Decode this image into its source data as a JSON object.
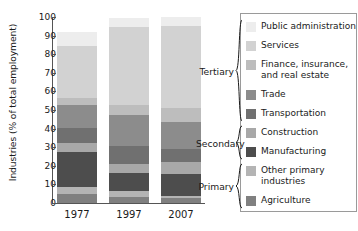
{
  "chart_data": {
    "type": "bar",
    "stacked": true,
    "title": "",
    "xlabel": "",
    "ylabel": "Industries (% of total employment)",
    "categories": [
      "1977",
      "1997",
      "2007"
    ],
    "ylim": [
      0,
      100
    ],
    "yticks": [
      0,
      10,
      20,
      30,
      40,
      50,
      60,
      70,
      80,
      90,
      100
    ],
    "grid": false,
    "legend_position": "right",
    "series": [
      {
        "name": "Agriculture",
        "group": "Primary",
        "color": "#808080",
        "values": [
          5.0,
          3.5,
          2.5
        ]
      },
      {
        "name": "Other primary industries",
        "group": "Primary",
        "color": "#b4b4b4",
        "values": [
          3.5,
          3.0,
          1.5
        ]
      },
      {
        "name": "Manufacturing",
        "group": "Secondary",
        "color": "#4d4d4d",
        "values": [
          19.0,
          9.5,
          11.5
        ]
      },
      {
        "name": "Construction",
        "group": "Secondary",
        "color": "#a8a8a8",
        "values": [
          5.0,
          5.0,
          6.5
        ]
      },
      {
        "name": "Transportation",
        "group": "Tertiary",
        "color": "#707070",
        "values": [
          8.0,
          9.5,
          7.0
        ]
      },
      {
        "name": "Trade",
        "group": "Tertiary",
        "color": "#8c8c8c",
        "values": [
          12.0,
          17.0,
          14.5
        ]
      },
      {
        "name": "Finance, insurance, and real estate",
        "group": "Tertiary",
        "color": "#bdbdbd",
        "values": [
          4.0,
          5.0,
          7.5
        ]
      },
      {
        "name": "Services",
        "group": "Tertiary",
        "color": "#d2d2d2",
        "values": [
          28.0,
          42.0,
          44.0
        ]
      },
      {
        "name": "Public administration",
        "group": "Tertiary",
        "color": "#ededed",
        "values": [
          7.5,
          5.0,
          5.0
        ]
      }
    ]
  },
  "axis": {
    "ylabel": "Industries (% of total employment)",
    "ytick_labels": [
      "0",
      "10",
      "20",
      "30",
      "40",
      "50",
      "60",
      "70",
      "80",
      "90",
      "100"
    ],
    "xtick_labels": [
      "1977",
      "1997",
      "2007"
    ]
  },
  "legend": {
    "items": [
      {
        "label": "Public administration",
        "color": "#ededed"
      },
      {
        "label": "Services",
        "color": "#d2d2d2"
      },
      {
        "label": "Finance, insurance,\nand real estate",
        "color": "#bdbdbd"
      },
      {
        "label": "Trade",
        "color": "#8c8c8c"
      },
      {
        "label": "Transportation",
        "color": "#707070"
      },
      {
        "label": "Construction",
        "color": "#a8a8a8"
      },
      {
        "label": "Manufacturing",
        "color": "#4d4d4d"
      },
      {
        "label": "Other primary\nindustries",
        "color": "#b4b4b4"
      },
      {
        "label": "Agriculture",
        "color": "#808080"
      }
    ],
    "groups": [
      {
        "label": "Tertiary",
        "count": 5
      },
      {
        "label": "Secondary",
        "count": 2
      },
      {
        "label": "Primary",
        "count": 2
      }
    ]
  }
}
